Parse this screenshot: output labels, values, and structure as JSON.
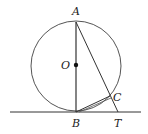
{
  "figure": {
    "points": {
      "A": {
        "label": "A",
        "x": 76,
        "y": 22
      },
      "O": {
        "label": "O",
        "x": 76,
        "y": 65
      },
      "B": {
        "label": "B",
        "x": 76,
        "y": 112
      },
      "C": {
        "label": "C",
        "x": 110,
        "y": 96
      },
      "T": {
        "label": "T",
        "x": 118,
        "y": 112
      }
    },
    "circle": {
      "cx": 76,
      "cy": 66,
      "r": 45
    },
    "tangent_line": {
      "x1": 10,
      "y1": 112,
      "x2": 141,
      "y2": 112
    },
    "stroke_color": "#333333"
  }
}
